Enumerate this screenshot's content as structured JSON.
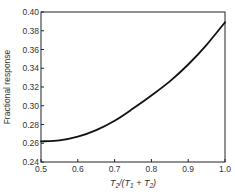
{
  "chart_data": {
    "type": "line",
    "title": "",
    "xlabel": "T2/(T1 + T2)",
    "xlabel_parts": {
      "T1": "T",
      "sub1": "1",
      "T2": "T",
      "sub2": "2"
    },
    "ylabel": "Fractional response",
    "xlim": [
      0.5,
      1.0
    ],
    "ylim": [
      0.24,
      0.4
    ],
    "grid": false,
    "legend": null,
    "x_ticks": [
      0.5,
      0.6,
      0.7,
      0.8,
      0.9,
      1.0
    ],
    "x_tick_labels": [
      "0.5",
      "0.6",
      "0.7",
      "0.8",
      "0.9",
      "1.0"
    ],
    "y_ticks": [
      0.24,
      0.26,
      0.28,
      0.3,
      0.32,
      0.34,
      0.36,
      0.38,
      0.4
    ],
    "y_tick_labels": [
      "0.24",
      "0.26",
      "0.28",
      "0.30",
      "0.32",
      "0.34",
      "0.36",
      "0.38",
      "0.40"
    ],
    "series": [
      {
        "name": "Fractional response",
        "color": "#111111",
        "x": [
          0.5,
          0.55,
          0.6,
          0.65,
          0.7,
          0.75,
          0.8,
          0.85,
          0.9,
          0.95,
          1.0
        ],
        "values": [
          0.262,
          0.263,
          0.267,
          0.274,
          0.284,
          0.297,
          0.311,
          0.326,
          0.344,
          0.365,
          0.389
        ]
      }
    ]
  },
  "layout": {
    "plot_left": 41,
    "plot_right": 225,
    "plot_top": 12,
    "plot_bottom": 162
  }
}
